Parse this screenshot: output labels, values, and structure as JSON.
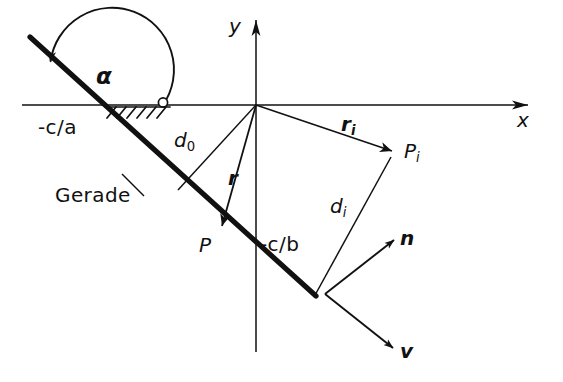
{
  "figure": {
    "background_color": "#ffffff",
    "ink_color": "#111111",
    "width": 563,
    "height": 382
  },
  "axes": {
    "x_label": "x",
    "y_label": "y",
    "origin_label": ""
  },
  "labels": {
    "angle": "α",
    "x_intercept": "-c/a",
    "y_intercept": "-c/b",
    "line_name": "Gerade",
    "point_p": "P",
    "point_pi_base": "P",
    "point_pi_sub": "i",
    "dist_d0_base": "d",
    "dist_d0_sub": "0",
    "dist_di_base": "d",
    "dist_di_sub": "i",
    "vec_r": "r",
    "vec_ri_base": "r",
    "vec_ri_sub": "i",
    "vec_n": "n",
    "vec_v": "v"
  },
  "elements": {
    "line_gerade": "thick straight line",
    "angle_arc": "angle arc alpha from x-axis to line",
    "hatching": "hatched ground marks on x-axis",
    "pivot_circle": "small circle at arc foot on x-axis"
  }
}
